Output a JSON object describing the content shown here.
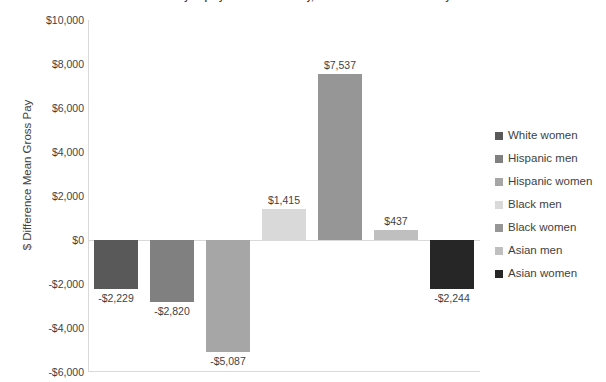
{
  "chart_data": {
    "type": "bar",
    "title": "Mean Gender Pay Gap by Race and Ethnicity, Difference in Mean Gross Pay",
    "xlabel": "",
    "ylabel": "$ Difference Mean Gross Pay",
    "categories": [
      "White women",
      "Hispanic men",
      "Hispanic women",
      "Black men",
      "Black women",
      "Asian men",
      "Asian women"
    ],
    "values": [
      -2229,
      -2820,
      -5087,
      1415,
      7537,
      437,
      -2244
    ],
    "data_labels": [
      "-$2,229",
      "-$2,820",
      "-$5,087",
      "$1,415",
      "$7,537",
      "$437",
      "-$2,244"
    ],
    "series": [
      {
        "name": "$ Difference Mean Gross Pay",
        "values": [
          -2229,
          -2820,
          -5087,
          1415,
          7537,
          437,
          -2244
        ]
      }
    ],
    "colors": [
      "#595959",
      "#808080",
      "#a6a6a6",
      "#d9d9d9",
      "#969696",
      "#bfbfbf",
      "#262626"
    ],
    "ylim": [
      -6000,
      10000
    ],
    "ytick_step": 2000,
    "ytick_labels": [
      "$10,000",
      "$8,000",
      "$6,000",
      "$4,000",
      "$2,000",
      "$0",
      "-$2,000",
      "-$4,000",
      "-$6,000"
    ],
    "ytick_values": [
      10000,
      8000,
      6000,
      4000,
      2000,
      0,
      -2000,
      -4000,
      -6000
    ],
    "grid": false,
    "legend_position": "right"
  },
  "legend": {
    "items": [
      {
        "label": "White women",
        "color": "#595959"
      },
      {
        "label": "Hispanic men",
        "color": "#808080"
      },
      {
        "label": "Hispanic women",
        "color": "#a6a6a6"
      },
      {
        "label": "Black men",
        "color": "#d9d9d9"
      },
      {
        "label": "Black women",
        "color": "#969696"
      },
      {
        "label": "Asian men",
        "color": "#bfbfbf"
      },
      {
        "label": "Asian women",
        "color": "#262626"
      }
    ]
  }
}
